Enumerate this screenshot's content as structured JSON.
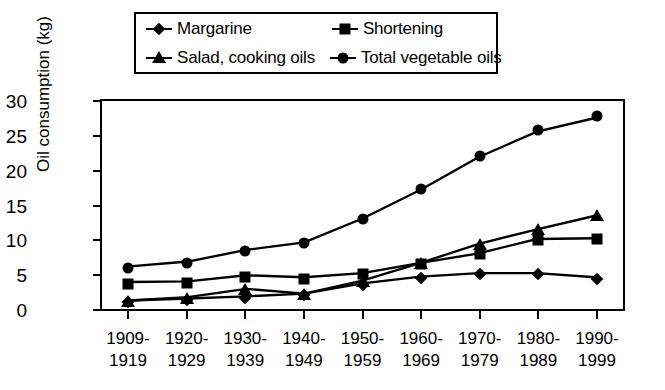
{
  "chart_data": {
    "type": "line",
    "title": "",
    "xlabel": "",
    "ylabel": "Oil consumption (kg)",
    "ylim": [
      0,
      30
    ],
    "yticks": [
      0,
      5,
      10,
      15,
      20,
      25,
      30
    ],
    "grid": false,
    "legend_position": "top-center",
    "categories": [
      "1909-\n1919",
      "1920-\n1929",
      "1930-\n1939",
      "1940-\n1949",
      "1950-\n1959",
      "1960-\n1969",
      "1970-\n1979",
      "1980-\n1989",
      "1990-\n1999"
    ],
    "category_lines": [
      [
        "1909-",
        "1919"
      ],
      [
        "1920-",
        "1929"
      ],
      [
        "1930-",
        "1939"
      ],
      [
        "1940-",
        "1949"
      ],
      [
        "1950-",
        "1959"
      ],
      [
        "1960-",
        "1969"
      ],
      [
        "1970-",
        "1979"
      ],
      [
        "1980-",
        "1989"
      ],
      [
        "1990-",
        "1999"
      ]
    ],
    "series": [
      {
        "name": "Margarine",
        "marker": "diamond",
        "values": [
          1.1,
          1.4,
          1.7,
          2.1,
          3.6,
          4.6,
          5.1,
          5.1,
          4.5
        ]
      },
      {
        "name": "Shortening",
        "marker": "square",
        "values": [
          3.8,
          3.9,
          4.8,
          4.5,
          5.1,
          6.6,
          8.0,
          10.1,
          10.2
        ]
      },
      {
        "name": "Salad, cooking oils",
        "marker": "triangle",
        "values": [
          1.1,
          1.6,
          2.8,
          2.1,
          4.0,
          6.6,
          9.4,
          11.5,
          13.5
        ]
      },
      {
        "name": "Total vegetable oils",
        "marker": "circle",
        "values": [
          6.1,
          6.8,
          8.5,
          9.6,
          13.1,
          17.3,
          22.1,
          25.8,
          27.8
        ]
      }
    ],
    "colors": {
      "line": "#000000",
      "marker": "#000000",
      "background": "#ffffff",
      "axis": "#000000"
    }
  },
  "legend": {
    "entries": [
      {
        "label": "Margarine",
        "marker": "diamond"
      },
      {
        "label": "Shortening",
        "marker": "square"
      },
      {
        "label": "Salad, cooking oils",
        "marker": "triangle"
      },
      {
        "label": "Total vegetable oils",
        "marker": "circle"
      }
    ]
  }
}
